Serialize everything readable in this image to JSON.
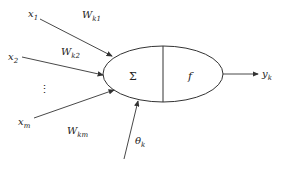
{
  "diagram": {
    "type": "artificial-neuron-model",
    "inputs": [
      {
        "label": "x",
        "sub": "1",
        "weight": "W",
        "weight_sub": "k1"
      },
      {
        "label": "x",
        "sub": "2",
        "weight": "W",
        "weight_sub": "k2"
      },
      {
        "label": "x",
        "sub": "m",
        "weight": "W",
        "weight_sub": "km"
      }
    ],
    "ellipsis": "⋮",
    "summation": "Σ",
    "activation": "f",
    "bias": {
      "label": "θ",
      "sub": "k"
    },
    "output": {
      "label": "y",
      "sub": "k"
    },
    "colors": {
      "stroke": "#333333",
      "text": "#222222",
      "background": "#ffffff"
    }
  }
}
